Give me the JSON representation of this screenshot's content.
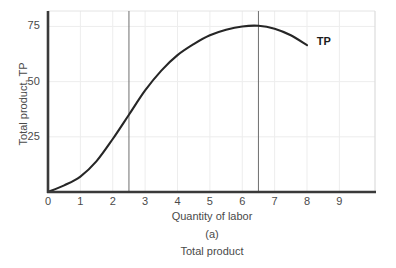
{
  "figure": {
    "panel_letter": "(a)",
    "panel_caption": "Total product",
    "background_color": "#ffffff",
    "axis_color": "#3a3a3a",
    "curve_color": "#262626",
    "grid_color": "#ededed",
    "reference_line_color": "#6f6f6f"
  },
  "chart_data": {
    "type": "line",
    "title": "",
    "subtitle": "",
    "xlabel": "Quantity of labor",
    "ylabel": "Total product, TP",
    "xlim": [
      0,
      10.1
    ],
    "ylim": [
      0,
      82
    ],
    "xticks": [
      0,
      1,
      2,
      3,
      4,
      5,
      6,
      7,
      8,
      9
    ],
    "xtick_labels": [
      "0",
      "1",
      "2",
      "3",
      "4",
      "5",
      "6",
      "7",
      "8",
      "9"
    ],
    "yticks": [
      25,
      50,
      75
    ],
    "ytick_labels": [
      "25",
      "50",
      "75"
    ],
    "grid": true,
    "grid_axis": "both",
    "legend_position": "inline-end-of-curve",
    "series": [
      {
        "name": "TP",
        "label": "TP",
        "label_x": 8.3,
        "label_y": 68,
        "points": [
          {
            "x": 0.0,
            "y": 0
          },
          {
            "x": 0.5,
            "y": 3
          },
          {
            "x": 1.0,
            "y": 7
          },
          {
            "x": 1.5,
            "y": 14
          },
          {
            "x": 2.0,
            "y": 24
          },
          {
            "x": 2.5,
            "y": 35
          },
          {
            "x": 3.0,
            "y": 46
          },
          {
            "x": 3.5,
            "y": 55
          },
          {
            "x": 4.0,
            "y": 62
          },
          {
            "x": 4.5,
            "y": 67
          },
          {
            "x": 5.0,
            "y": 71
          },
          {
            "x": 5.5,
            "y": 73.5
          },
          {
            "x": 6.0,
            "y": 75
          },
          {
            "x": 6.5,
            "y": 75.3
          },
          {
            "x": 7.0,
            "y": 74
          },
          {
            "x": 7.5,
            "y": 71
          },
          {
            "x": 8.0,
            "y": 66.5
          }
        ]
      }
    ],
    "reference_lines": [
      {
        "orientation": "vertical",
        "x": 2.5,
        "note": "inflection point"
      },
      {
        "orientation": "vertical",
        "x": 6.5,
        "note": "maximum total product"
      }
    ],
    "annotations": [
      {
        "text": "TP",
        "x": 8.3,
        "y": 68,
        "bold": true
      }
    ]
  }
}
